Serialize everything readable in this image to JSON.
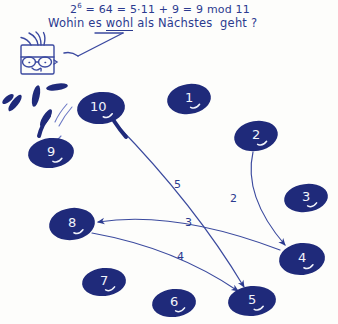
{
  "note": {
    "equation_plain": "2⁶ = 64 = 5·11 + 9 = 9 mod 11",
    "equation_base": "2",
    "equation_exponent": "6",
    "equation_rest": " = 64 = 5·11 + 9 = 9 mod 11",
    "question_pre": "Wohin es ",
    "question_underlined": "wohl",
    "question_post": " als Nächstes  geht ?"
  },
  "doodle": {
    "face_label": "face-with-glasses",
    "pointer_label": "pointer-arrow"
  },
  "colors": {
    "ink": "#2b3a8f",
    "node_fill": "#1f2a7a",
    "node_text": "#f2f4fb",
    "paper": "#fdfdfb"
  },
  "graph": {
    "nodes": [
      {
        "id": "1",
        "label": "1",
        "x": 189,
        "y": 99,
        "rx": 22,
        "ry": 15,
        "rot": -8,
        "tail": 30
      },
      {
        "id": "2",
        "label": "2",
        "x": 256,
        "y": 136,
        "rx": 22,
        "ry": 15,
        "rot": -10,
        "tail": 35
      },
      {
        "id": "3",
        "label": "3",
        "x": 306,
        "y": 198,
        "rx": 22,
        "ry": 14,
        "rot": -8,
        "tail": 30
      },
      {
        "id": "4",
        "label": "4",
        "x": 302,
        "y": 259,
        "rx": 23,
        "ry": 16,
        "rot": -6,
        "tail": 32
      },
      {
        "id": "5",
        "label": "5",
        "x": 252,
        "y": 301,
        "rx": 24,
        "ry": 15,
        "rot": -5,
        "tail": 30
      },
      {
        "id": "6",
        "label": "6",
        "x": 174,
        "y": 303,
        "rx": 22,
        "ry": 14,
        "rot": -6,
        "tail": 30
      },
      {
        "id": "7",
        "label": "7",
        "x": 104,
        "y": 282,
        "rx": 22,
        "ry": 14,
        "rot": -6,
        "tail": 30
      },
      {
        "id": "8",
        "label": "8",
        "x": 72,
        "y": 224,
        "rx": 23,
        "ry": 16,
        "rot": -8,
        "tail": 32
      },
      {
        "id": "9",
        "label": "9",
        "x": 51,
        "y": 153,
        "rx": 23,
        "ry": 15,
        "rot": -6,
        "tail": 28
      },
      {
        "id": "10",
        "label": "10",
        "x": 101,
        "y": 108,
        "rx": 24,
        "ry": 16,
        "rot": -6,
        "tail": 30
      }
    ],
    "edges": [
      {
        "from": "10",
        "to": "5",
        "label": "5",
        "label_x": 174,
        "label_y": 178
      },
      {
        "from": "2",
        "to": "4",
        "label": "2",
        "label_x": 230,
        "label_y": 192
      },
      {
        "from": "4",
        "to": "8",
        "label": "3",
        "label_x": 185,
        "label_y": 216
      },
      {
        "from": "8",
        "to": "5",
        "label": "4",
        "label_x": 177,
        "label_y": 250
      }
    ],
    "spark_marks": 5
  }
}
